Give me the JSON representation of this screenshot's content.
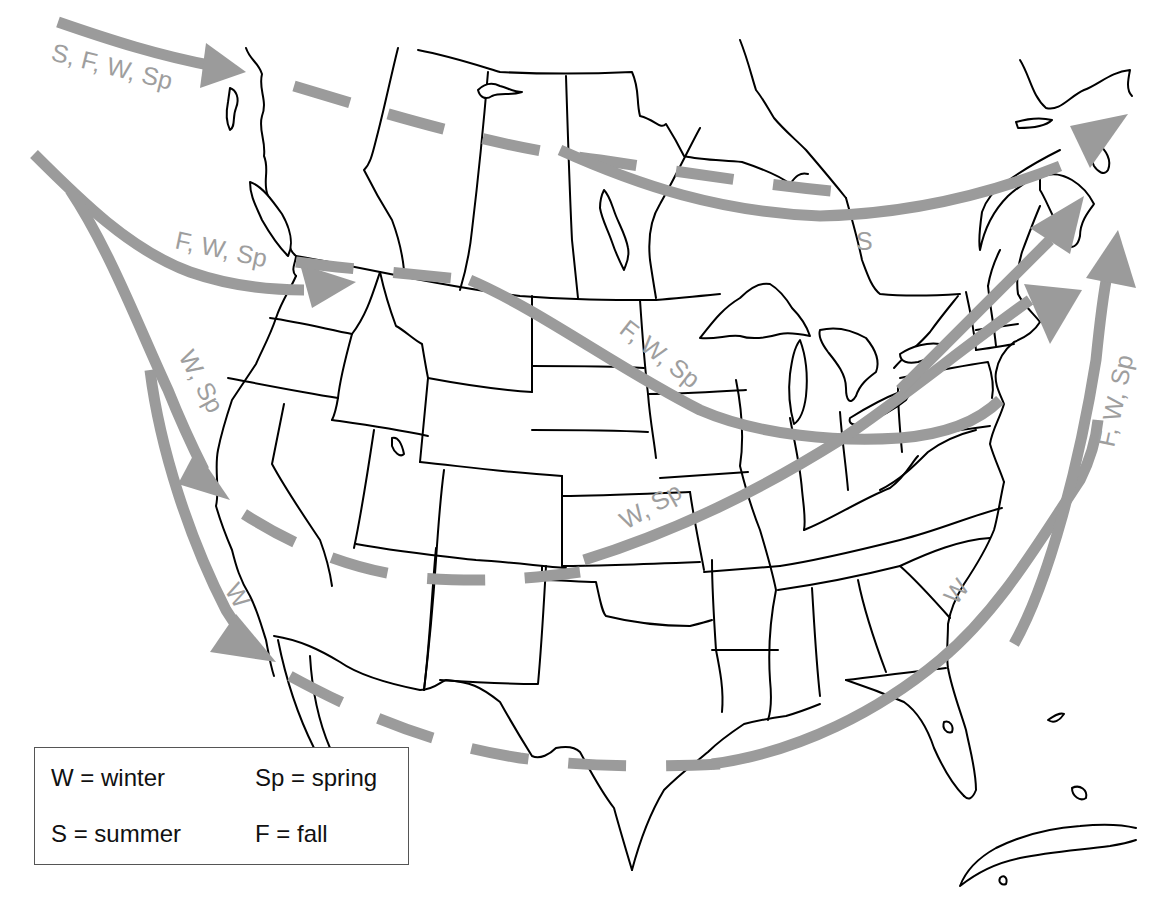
{
  "map": {
    "title": "Seasonal storm tracks across North America",
    "track_color": "#9b9b9b",
    "outline_color": "#000000",
    "tracks": [
      {
        "id": "alberta-track",
        "label": "S, F, W, Sp",
        "style": "solid-then-dashed",
        "arrow": true
      },
      {
        "id": "pacific-northwest-track",
        "label": "F, W, Sp",
        "style": "solid",
        "arrow": true
      },
      {
        "id": "northern-plains-track",
        "label": "F, W, Sp",
        "style": "solid",
        "arrow": false
      },
      {
        "id": "canada-summer-track",
        "label": "S",
        "style": "solid",
        "arrow": true
      },
      {
        "id": "california-track",
        "label": "W, Sp",
        "style": "solid",
        "arrow": true
      },
      {
        "id": "baja-track",
        "label": "W",
        "style": "solid",
        "arrow": true
      },
      {
        "id": "colorado-track",
        "label": "W, Sp",
        "style": "solid",
        "arrow": true
      },
      {
        "id": "gulf-track",
        "label": "W",
        "style": "solid",
        "arrow": true
      },
      {
        "id": "atlantic-track",
        "label": "F, W, Sp",
        "style": "solid",
        "arrow": true
      }
    ]
  },
  "labels": {
    "sfwsp": "S, F, W, Sp",
    "fwsp_nw": "F, W, Sp",
    "fwsp_plains": "F, W, Sp",
    "s_canada": "S",
    "wsp_ca": "W, Sp",
    "w_baja": "W",
    "wsp_co": "W, Sp",
    "w_se": "W",
    "fwsp_atl": "F, W, Sp"
  },
  "legend": {
    "items": [
      {
        "code": "W",
        "text": "W = winter"
      },
      {
        "code": "Sp",
        "text": "Sp = spring"
      },
      {
        "code": "S",
        "text": "S = summer"
      },
      {
        "code": "F",
        "text": "F = fall"
      }
    ]
  }
}
